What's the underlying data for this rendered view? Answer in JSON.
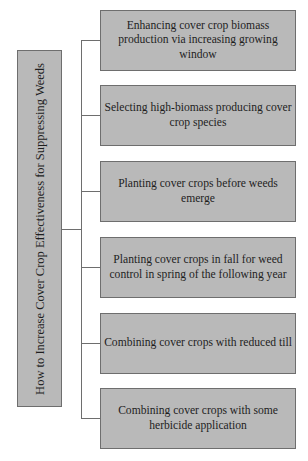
{
  "diagram": {
    "type": "tree",
    "orientation": "left-to-right",
    "root": {
      "label": "How to Increase Cover Crop Effectiveness for Suppressing Weeds"
    },
    "branches": [
      {
        "label": "Enhancing cover crop biomass production via increasing growing window"
      },
      {
        "label": "Selecting high-biomass producing cover crop species"
      },
      {
        "label": "Planting cover crops before weeds emerge"
      },
      {
        "label": "Planting cover crops in fall for weed control in spring of the following year"
      },
      {
        "label": "Combining cover crops with reduced till"
      },
      {
        "label": "Combining cover crops with some herbicide application"
      }
    ],
    "colors": {
      "box_fill": "#b9b9b9",
      "box_border": "#6e6e6e",
      "connector": "#6e6e6e",
      "text": "#1e1e1e",
      "background": "#ffffff"
    }
  }
}
